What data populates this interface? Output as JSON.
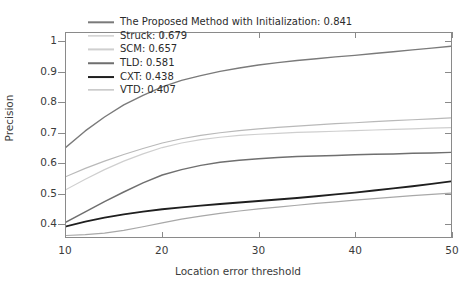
{
  "chart_data": {
    "type": "line",
    "title": "",
    "xlabel": "Location error threshold",
    "ylabel": "Precision",
    "xlim": [
      10,
      50
    ],
    "ylim": [
      0.355,
      1.03
    ],
    "grid": false,
    "legend_position": "upper left (inside axes, no frame)",
    "xticks": [
      10,
      20,
      30,
      40,
      50
    ],
    "xtick_labels": [
      "10",
      "20",
      "30",
      "40",
      "50"
    ],
    "yticks": [
      0.4,
      0.5,
      0.6,
      0.7,
      0.8,
      0.9,
      1
    ],
    "ytick_labels": [
      "0.4",
      "0.5",
      "0.6",
      "0.7",
      "0.8",
      "0.9",
      "1"
    ],
    "x": [
      10,
      12,
      14,
      16,
      18,
      20,
      22,
      24,
      26,
      28,
      30,
      32,
      34,
      36,
      38,
      40,
      42,
      44,
      46,
      48,
      50
    ],
    "series": [
      {
        "name": "The Proposed Method with Initialization",
        "score": 0.841,
        "label": "The Proposed Method with Initialization: 0.841",
        "color": "#7a7a7a",
        "width": 1.4,
        "values": [
          0.652,
          0.706,
          0.752,
          0.792,
          0.824,
          0.852,
          0.873,
          0.889,
          0.903,
          0.914,
          0.924,
          0.932,
          0.939,
          0.945,
          0.951,
          0.956,
          0.962,
          0.968,
          0.974,
          0.98,
          0.986
        ]
      },
      {
        "name": "Struck",
        "score": 0.679,
        "label": "Struck: 0.679",
        "color": "#b9b9b9",
        "width": 1.2,
        "values": [
          0.555,
          0.582,
          0.606,
          0.628,
          0.648,
          0.666,
          0.68,
          0.691,
          0.7,
          0.707,
          0.713,
          0.718,
          0.722,
          0.726,
          0.73,
          0.733,
          0.737,
          0.74,
          0.743,
          0.746,
          0.749
        ]
      },
      {
        "name": "SCM",
        "score": 0.657,
        "label": "SCM: 0.657",
        "color": "#cfcfcf",
        "width": 1.2,
        "values": [
          0.512,
          0.546,
          0.578,
          0.606,
          0.63,
          0.651,
          0.666,
          0.677,
          0.685,
          0.691,
          0.695,
          0.698,
          0.701,
          0.703,
          0.705,
          0.707,
          0.709,
          0.711,
          0.713,
          0.715,
          0.717
        ]
      },
      {
        "name": "TLD",
        "score": 0.581,
        "label": "TLD: 0.581",
        "color": "#6f6f6f",
        "width": 1.5,
        "values": [
          0.404,
          0.438,
          0.472,
          0.504,
          0.534,
          0.56,
          0.578,
          0.592,
          0.602,
          0.609,
          0.614,
          0.618,
          0.621,
          0.623,
          0.625,
          0.627,
          0.629,
          0.63,
          0.632,
          0.633,
          0.635
        ]
      },
      {
        "name": "CXT",
        "score": 0.438,
        "label": "CXT: 0.438",
        "color": "#1f1f1f",
        "width": 1.9,
        "values": [
          0.39,
          0.406,
          0.419,
          0.43,
          0.439,
          0.447,
          0.453,
          0.459,
          0.464,
          0.469,
          0.474,
          0.479,
          0.484,
          0.49,
          0.496,
          0.502,
          0.509,
          0.516,
          0.523,
          0.531,
          0.539
        ]
      },
      {
        "name": "VTD",
        "score": 0.407,
        "label": "VTD: 0.407",
        "color": "#a8a8a8",
        "width": 1.2,
        "values": [
          0.36,
          0.363,
          0.368,
          0.377,
          0.389,
          0.402,
          0.414,
          0.424,
          0.433,
          0.441,
          0.448,
          0.454,
          0.46,
          0.466,
          0.471,
          0.477,
          0.482,
          0.487,
          0.492,
          0.496,
          0.5
        ]
      }
    ]
  }
}
